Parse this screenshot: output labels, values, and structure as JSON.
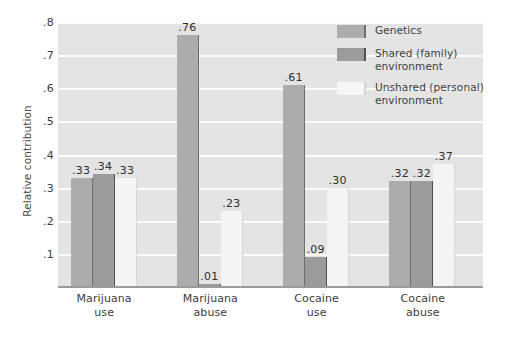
{
  "chart_data": {
    "type": "bar",
    "title": "",
    "xlabel": "",
    "ylabel": "Relative contribution",
    "ylim": [
      0,
      0.8
    ],
    "grid": true,
    "legend_position": "top-right",
    "y_ticks": [
      ".8",
      ".7",
      ".6",
      ".5",
      ".4",
      ".3",
      ".2",
      ".1"
    ],
    "y_tick_values": [
      0.8,
      0.7,
      0.6,
      0.5,
      0.4,
      0.3,
      0.2,
      0.1
    ],
    "categories": [
      {
        "line1": "Marijuana",
        "line2": "use"
      },
      {
        "line1": "Marijuana",
        "line2": "abuse"
      },
      {
        "line1": "Cocaine",
        "line2": "use"
      },
      {
        "line1": "Cocaine",
        "line2": "abuse"
      }
    ],
    "series": [
      {
        "name": "Genetics",
        "legend_line1": "Genetics",
        "legend_line2": "",
        "color": "#acacac",
        "values": [
          0.33,
          0.76,
          0.61,
          0.32
        ],
        "labels": [
          ".33",
          ".76",
          ".61",
          ".32"
        ]
      },
      {
        "name": "Shared (family) environment",
        "legend_line1": "Shared (family)",
        "legend_line2": "environment",
        "color": "#9b9b9b",
        "values": [
          0.34,
          0.01,
          0.09,
          0.32
        ],
        "labels": [
          ".34",
          ".01",
          ".09",
          ".32"
        ]
      },
      {
        "name": "Unshared (personal) environment",
        "legend_line1": "Unshared (personal)",
        "legend_line2": "environment",
        "color": "#f4f4f4",
        "values": [
          0.33,
          0.23,
          0.3,
          0.37
        ],
        "labels": [
          ".33",
          ".23",
          ".30",
          ".37"
        ]
      }
    ]
  }
}
